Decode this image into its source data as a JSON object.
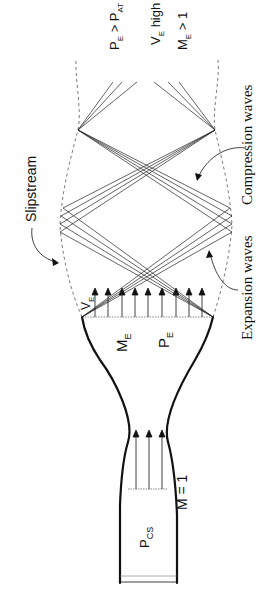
{
  "diagram": {
    "orientation": "rotated 90° counter-clockwise; flow direction toward top of page",
    "labels": {
      "chamber_pressure": "P",
      "chamber_pressure_sub": "CS",
      "throat_mach": "M = 1",
      "exit_velocity": "V",
      "exit_velocity_sub": "E",
      "exit_mach": "M",
      "exit_mach_sub": "E",
      "exit_pressure": "P",
      "exit_pressure_sub": "E",
      "slipstream": "Slipstream",
      "expansion_waves": "Expansion waves",
      "compression_waves": "Compression waves",
      "cond1_a": "P",
      "cond1_a_sub": "E",
      "cond1_op": " > ",
      "cond1_b": "P",
      "cond1_b_sub": "AT",
      "cond2_a": "V",
      "cond2_a_sub": "E",
      "cond2_rest": " high",
      "cond3_a": "M",
      "cond3_a_sub": "E",
      "cond3_rest": " > 1"
    },
    "colors": {
      "ink": "#111111",
      "background": "#ffffff",
      "dashed": "#555555"
    }
  }
}
